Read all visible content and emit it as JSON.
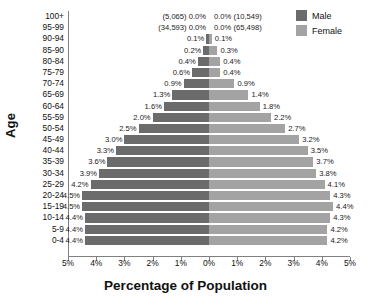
{
  "chart_data": {
    "type": "bar",
    "subtype": "population-pyramid",
    "title": "",
    "xlabel": "Percentage of Population",
    "ylabel": "Age",
    "xlim": [
      -5,
      5
    ],
    "xticks": [
      "5%",
      "4%",
      "3%",
      "2%",
      "1%",
      "0%",
      "1%",
      "2%",
      "3%",
      "4%",
      "5%"
    ],
    "xtick_values": [
      -5,
      -4,
      -3,
      -2,
      -1,
      0,
      1,
      2,
      3,
      4,
      5
    ],
    "grid": false,
    "legend_position": "top-right",
    "categories": [
      "100+",
      "95-99",
      "90-94",
      "85-90",
      "80-84",
      "75-79",
      "70-74",
      "65-69",
      "60-64",
      "55-59",
      "50-54",
      "45-49",
      "40-44",
      "35-39",
      "30-34",
      "25-29",
      "20-24",
      "15-19",
      "10-14",
      "5-9",
      "0-4"
    ],
    "series": [
      {
        "name": "Male",
        "color": "#6b6b6b",
        "values": [
          0.0,
          0.0,
          0.1,
          0.2,
          0.4,
          0.6,
          0.9,
          1.3,
          1.6,
          2.0,
          2.5,
          3.0,
          3.3,
          3.6,
          3.9,
          4.2,
          4.5,
          4.5,
          4.4,
          4.4,
          4.4
        ],
        "labels": [
          "0.0%",
          "0.0%",
          "0.1%",
          "0.2%",
          "0.4%",
          "0.6%",
          "0.9%",
          "1.3%",
          "1.6%",
          "2.0%",
          "2.5%",
          "3.0%",
          "3.3%",
          "3.6%",
          "3.9%",
          "4.2%",
          "4.5%",
          "4.5%",
          "4.4%",
          "4.4%",
          "4.4%"
        ],
        "counts": {
          "100+": "(5,065)",
          "95-99": "(34,593)"
        }
      },
      {
        "name": "Female",
        "color": "#a3a3a3",
        "values": [
          0.0,
          0.0,
          0.1,
          0.3,
          0.4,
          0.4,
          0.9,
          1.4,
          1.8,
          2.2,
          2.7,
          3.2,
          3.5,
          3.7,
          3.8,
          4.1,
          4.3,
          4.4,
          4.3,
          4.2,
          4.2
        ],
        "labels": [
          "0.0%",
          "0.0%",
          "0.1%",
          "0.3%",
          "0.4%",
          "0.4%",
          "0.9%",
          "1.4%",
          "1.8%",
          "2.2%",
          "2.7%",
          "3.2%",
          "3.5%",
          "3.7%",
          "3.8%",
          "4.1%",
          "4.3%",
          "4.4%",
          "4.3%",
          "4.2%",
          "4.2%"
        ],
        "counts": {
          "100+": "(10,549)",
          "95-99": "(65,498)"
        }
      }
    ],
    "annotations": [
      {
        "row": "100+",
        "male_text": "(5,065) 0.0%",
        "female_text": "0.0% (10,549)"
      },
      {
        "row": "95-99",
        "male_text": "(34,593) 0.0%",
        "female_text": "0.0% (65,498)"
      }
    ]
  },
  "legend": {
    "items": [
      {
        "label": "Male",
        "color": "#6b6b6b"
      },
      {
        "label": "Female",
        "color": "#a3a3a3"
      }
    ]
  },
  "axis_titles": {
    "x": "Percentage of Population",
    "y": "Age"
  }
}
